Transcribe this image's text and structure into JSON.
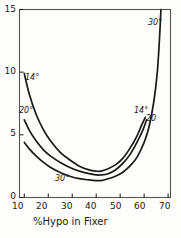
{
  "figure": {
    "background_color": "#fdfdfc",
    "ink_color": "#1a1a1a",
    "frame_color": "#555555"
  },
  "axis": {
    "x_title": "%Hypo in Fixer",
    "x_ticks": [
      "10",
      "20",
      "30",
      "40",
      "50",
      "60",
      "70"
    ],
    "y_ticks": [
      "0",
      "5",
      "10",
      "15"
    ]
  },
  "curve_labels": {
    "left_14": "14°",
    "left_20": "20°",
    "bottom_30": "30°",
    "right_14": "14°",
    "right_20": "20",
    "top_30": "30°"
  },
  "chart_data": {
    "type": "line",
    "title": "",
    "subtitle": "",
    "xlabel": "%Hypo in Fixer",
    "ylabel": "",
    "xlim": [
      8,
      71
    ],
    "ylim": [
      0,
      15
    ],
    "xticks": [
      10,
      20,
      30,
      40,
      50,
      60,
      70
    ],
    "yticks": [
      0,
      5,
      10,
      15
    ],
    "grid": false,
    "legend": "inline-curve-labels",
    "annotations": [
      {
        "text": "14°",
        "x": 13.5,
        "y": 8.9
      },
      {
        "text": "20°",
        "x": 11.5,
        "y": 6.3
      },
      {
        "text": "30°",
        "x": 30.5,
        "y": 1.9
      },
      {
        "text": "14°",
        "x": 56.5,
        "y": 6.9
      },
      {
        "text": "20",
        "x": 60.5,
        "y": 6.3
      },
      {
        "text": "30°",
        "x": 62.0,
        "y": 13.9
      }
    ],
    "series": [
      {
        "name": "14°",
        "x": [
          10,
          12,
          15,
          18,
          21,
          25,
          29,
          33,
          37,
          40,
          42,
          45,
          48,
          51,
          54,
          57,
          59,
          60.5
        ],
        "y": [
          9.9,
          8.3,
          6.6,
          5.4,
          4.5,
          3.6,
          3.0,
          2.5,
          2.2,
          2.1,
          2.1,
          2.3,
          2.6,
          3.1,
          3.9,
          4.9,
          5.8,
          6.4
        ]
      },
      {
        "name": "20°",
        "x": [
          10,
          12,
          15,
          18,
          21,
          25,
          29,
          33,
          37,
          40,
          42,
          45,
          48,
          51,
          54,
          57,
          59.5,
          61
        ],
        "y": [
          6.2,
          5.4,
          4.5,
          3.8,
          3.3,
          2.8,
          2.4,
          2.1,
          1.9,
          1.8,
          1.8,
          1.9,
          2.2,
          2.7,
          3.4,
          4.4,
          5.4,
          6.2
        ]
      },
      {
        "name": "30°",
        "x": [
          10,
          12,
          15,
          18,
          21,
          25,
          29,
          33,
          37,
          40,
          42,
          45,
          48,
          51,
          54,
          57,
          60,
          62,
          64,
          65.5,
          66.5,
          67
        ],
        "y": [
          4.4,
          3.9,
          3.3,
          2.8,
          2.4,
          2.0,
          1.7,
          1.5,
          1.4,
          1.35,
          1.35,
          1.5,
          1.7,
          2.0,
          2.5,
          3.2,
          4.4,
          5.6,
          7.6,
          10.0,
          13.0,
          15.0
        ]
      }
    ]
  }
}
